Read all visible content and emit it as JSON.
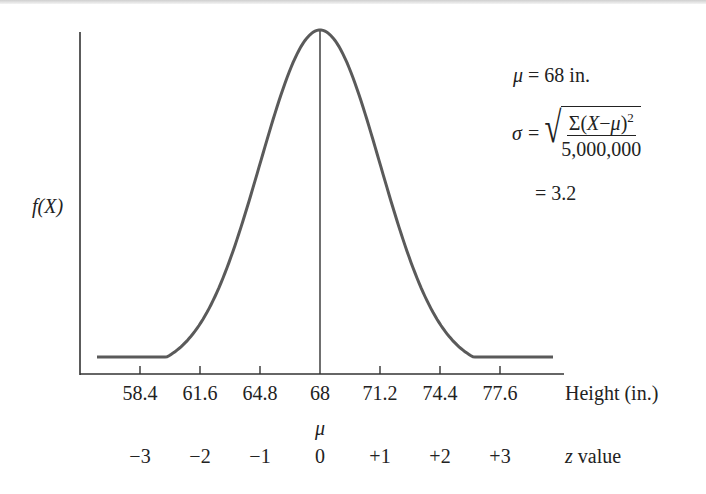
{
  "chart_data": {
    "type": "line",
    "title": "",
    "xlabel": "Height (in.)",
    "ylabel": "f(X)",
    "secondary_xlabel": "z value",
    "mean_label": "μ",
    "x_ticks": [
      "58.4",
      "61.6",
      "64.8",
      "68",
      "71.2",
      "74.4",
      "77.6"
    ],
    "x_tick_values": [
      58.4,
      61.6,
      64.8,
      68,
      71.2,
      74.4,
      77.6
    ],
    "z_ticks": [
      "−3",
      "−2",
      "−1",
      "0",
      "+1",
      "+2",
      "+3"
    ],
    "z_tick_values": [
      -3,
      -2,
      -1,
      0,
      1,
      2,
      3
    ],
    "xlim": [
      53.6,
      80.8
    ],
    "grid": false,
    "series": [
      {
        "name": "normal curve",
        "mean": 68,
        "sd": 3.2,
        "color": "#555555"
      }
    ],
    "annotations": {
      "mu_line": "μ = 68 in.",
      "sigma_symbol": "σ",
      "sigma_numerator": "Σ(X−μ)²",
      "sigma_denominator": "5,000,000",
      "sigma_result": "= 3.2"
    }
  },
  "colors": {
    "curve": "#5a5a5a",
    "axis": "#333333",
    "text": "#222222"
  }
}
